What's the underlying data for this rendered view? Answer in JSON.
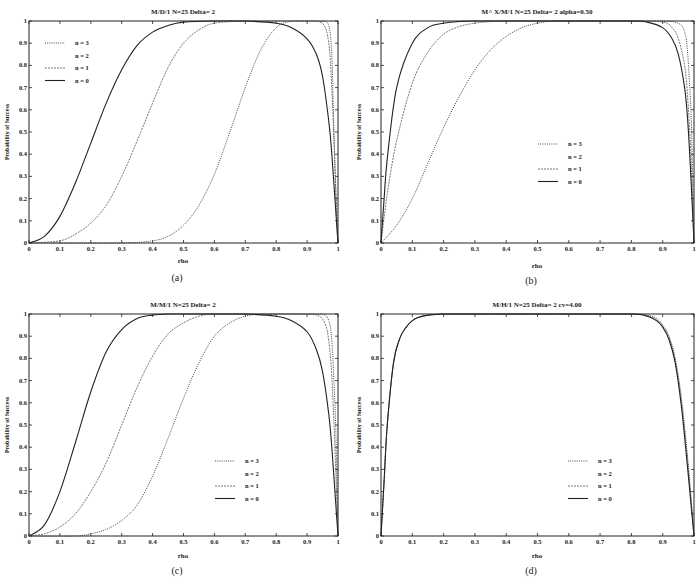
{
  "figure": {
    "panels": [
      {
        "id": "a",
        "caption": "(a)",
        "title": "M/D/1 N=25 Delta= 2",
        "ylabel": "Probability of Success",
        "xlabel": "rho",
        "box": {
          "left": 29,
          "right": 338,
          "top": 21,
          "bottom": 243
        },
        "legend": {
          "x": 45,
          "y": 43,
          "dy": 12.5
        }
      },
      {
        "id": "b",
        "caption": "(b)",
        "title": "M^ X/M/1 N=25 Delta= 2 alpha=0.50",
        "ylabel": "Probability of Success",
        "xlabel": "rho",
        "box": {
          "left": 381,
          "right": 694,
          "top": 21,
          "bottom": 243
        },
        "legend": {
          "x": 538,
          "y": 144,
          "dy": 12.5
        }
      },
      {
        "id": "c",
        "caption": "(c)",
        "title": "M/M/1 N=25 Delta= 2",
        "ylabel": "Probability of Success",
        "xlabel": "rho",
        "box": {
          "left": 29,
          "right": 338,
          "top": 314,
          "bottom": 536
        },
        "legend": {
          "x": 215,
          "y": 461,
          "dy": 12.5
        }
      },
      {
        "id": "d",
        "caption": "(d)",
        "title": "M/H/1 N=25 Delta= 2 cv=4.00",
        "ylabel": "Probability of Success",
        "xlabel": "rho",
        "box": {
          "left": 381,
          "right": 694,
          "top": 314,
          "bottom": 536
        },
        "legend": {
          "x": 568,
          "y": 461,
          "dy": 12.5
        }
      }
    ]
  },
  "chart_data": [
    {
      "type": "line",
      "panel": "a",
      "title": "M/D/1 N=25 Delta= 2",
      "xlabel": "rho",
      "ylabel": "Probability of Success",
      "xlim": [
        0,
        1
      ],
      "ylim": [
        0,
        1
      ],
      "xticks": [
        "0",
        "0.1",
        "0.2",
        "0.3",
        "0.4",
        "0.5",
        "0.6",
        "0.7",
        "0.8",
        "0.9",
        "1"
      ],
      "yticks": [
        "0",
        "0.1",
        "0.2",
        "0.3",
        "0.4",
        "0.5",
        "0.6",
        "0.7",
        "0.8",
        "0.9",
        "1"
      ],
      "grid": false,
      "legend_position": "upper left",
      "series": [
        {
          "name": "n = 3",
          "style": "dotted",
          "x": [
            0,
            0.3,
            0.4,
            0.45,
            0.5,
            0.55,
            0.6,
            0.65,
            0.7,
            0.75,
            0.8,
            0.85,
            0.9,
            0.95,
            0.97,
            0.98,
            0.985,
            0.99,
            0.995,
            1.0
          ],
          "y": [
            0,
            0.0,
            0.01,
            0.03,
            0.08,
            0.17,
            0.31,
            0.5,
            0.7,
            0.87,
            0.97,
            1.0,
            1.0,
            1.0,
            0.98,
            0.85,
            0.6,
            0.35,
            0.12,
            0.0
          ]
        },
        {
          "name": "n = 2",
          "style": "none",
          "x": [],
          "y": []
        },
        {
          "name": "n = 1",
          "style": "dashdot",
          "x": [
            0,
            0.1,
            0.15,
            0.2,
            0.25,
            0.3,
            0.35,
            0.4,
            0.45,
            0.5,
            0.55,
            0.6,
            0.7,
            0.8,
            0.9,
            0.95,
            0.97,
            0.98,
            0.99,
            1.0
          ],
          "y": [
            0,
            0.01,
            0.04,
            0.09,
            0.17,
            0.3,
            0.46,
            0.63,
            0.79,
            0.9,
            0.96,
            0.99,
            1.0,
            1.0,
            1.0,
            0.99,
            0.9,
            0.7,
            0.35,
            0.0
          ]
        },
        {
          "name": "n = 0",
          "style": "solid",
          "x": [
            0,
            0.05,
            0.1,
            0.15,
            0.2,
            0.25,
            0.3,
            0.35,
            0.4,
            0.45,
            0.5,
            0.6,
            0.7,
            0.8,
            0.85,
            0.9,
            0.93,
            0.95,
            0.97,
            0.98,
            0.99,
            1.0
          ],
          "y": [
            0,
            0.03,
            0.12,
            0.27,
            0.45,
            0.63,
            0.78,
            0.89,
            0.95,
            0.98,
            0.995,
            1.0,
            1.0,
            0.99,
            0.97,
            0.92,
            0.85,
            0.75,
            0.55,
            0.4,
            0.2,
            0.0
          ]
        }
      ]
    },
    {
      "type": "line",
      "panel": "b",
      "title": "M^ X/M/1 N=25 Delta= 2 alpha=0.50",
      "xlabel": "rho",
      "ylabel": "Probability of Success",
      "xlim": [
        0,
        1
      ],
      "ylim": [
        0,
        1
      ],
      "xticks": [
        "0",
        "0.1",
        "0.2",
        "0.3",
        "0.4",
        "0.5",
        "0.6",
        "0.7",
        "0.8",
        "0.9",
        "1"
      ],
      "yticks": [
        "0",
        "0.1",
        "0.2",
        "0.3",
        "0.4",
        "0.5",
        "0.6",
        "0.7",
        "0.8",
        "0.9",
        "1"
      ],
      "grid": false,
      "legend_position": "center right",
      "series": [
        {
          "name": "n = 3",
          "style": "dotted",
          "x": [
            0,
            0.05,
            0.1,
            0.15,
            0.2,
            0.25,
            0.3,
            0.35,
            0.4,
            0.45,
            0.5,
            0.55,
            0.6,
            0.7,
            0.8,
            0.9,
            0.95,
            0.97,
            0.98,
            0.99,
            0.995,
            1.0
          ],
          "y": [
            0,
            0.08,
            0.2,
            0.36,
            0.52,
            0.66,
            0.78,
            0.87,
            0.93,
            0.97,
            0.99,
            1.0,
            1.0,
            1.0,
            1.0,
            1.0,
            0.99,
            0.95,
            0.85,
            0.6,
            0.35,
            0.0
          ]
        },
        {
          "name": "n = 2",
          "style": "none",
          "x": [],
          "y": []
        },
        {
          "name": "n = 1",
          "style": "dashdot",
          "x": [
            0,
            0.02,
            0.05,
            0.1,
            0.15,
            0.2,
            0.25,
            0.3,
            0.35,
            0.4,
            0.5,
            0.6,
            0.8,
            0.9,
            0.93,
            0.95,
            0.97,
            0.98,
            0.99,
            1.0
          ],
          "y": [
            0,
            0.22,
            0.46,
            0.72,
            0.86,
            0.94,
            0.975,
            0.99,
            0.997,
            1.0,
            1.0,
            1.0,
            1.0,
            0.995,
            0.97,
            0.92,
            0.8,
            0.65,
            0.4,
            0.0
          ]
        },
        {
          "name": "n = 0",
          "style": "solid",
          "x": [
            0,
            0.01,
            0.02,
            0.05,
            0.1,
            0.15,
            0.2,
            0.25,
            0.3,
            0.4,
            0.6,
            0.8,
            0.85,
            0.9,
            0.93,
            0.95,
            0.97,
            0.98,
            0.99,
            1.0
          ],
          "y": [
            0,
            0.2,
            0.38,
            0.7,
            0.9,
            0.97,
            0.99,
            0.998,
            1.0,
            1.0,
            1.0,
            1.0,
            0.995,
            0.97,
            0.92,
            0.85,
            0.7,
            0.55,
            0.3,
            0.0
          ]
        }
      ]
    },
    {
      "type": "line",
      "panel": "c",
      "title": "M/M/1 N=25 Delta= 2",
      "xlabel": "rho",
      "ylabel": "Probability of Success",
      "xlim": [
        0,
        1
      ],
      "ylim": [
        0,
        1
      ],
      "xticks": [
        "0",
        "0.1",
        "0.2",
        "0.3",
        "0.4",
        "0.5",
        "0.6",
        "0.7",
        "0.8",
        "0.9",
        "1"
      ],
      "yticks": [
        "0",
        "0.1",
        "0.2",
        "0.3",
        "0.4",
        "0.5",
        "0.6",
        "0.7",
        "0.8",
        "0.9",
        "1"
      ],
      "grid": false,
      "legend_position": "center right",
      "series": [
        {
          "name": "n = 3",
          "style": "dotted",
          "x": [
            0,
            0.15,
            0.2,
            0.25,
            0.3,
            0.35,
            0.4,
            0.45,
            0.5,
            0.55,
            0.6,
            0.65,
            0.7,
            0.75,
            0.8,
            0.9,
            0.95,
            0.97,
            0.98,
            0.99,
            0.995,
            1.0
          ],
          "y": [
            0,
            0.0,
            0.01,
            0.03,
            0.07,
            0.14,
            0.27,
            0.44,
            0.62,
            0.78,
            0.9,
            0.96,
            0.99,
            1.0,
            1.0,
            1.0,
            1.0,
            0.97,
            0.88,
            0.6,
            0.35,
            0.0
          ]
        },
        {
          "name": "n = 2",
          "style": "none",
          "x": [],
          "y": []
        },
        {
          "name": "n = 1",
          "style": "dashdot",
          "x": [
            0,
            0.05,
            0.1,
            0.15,
            0.2,
            0.25,
            0.3,
            0.35,
            0.4,
            0.45,
            0.5,
            0.55,
            0.6,
            0.7,
            0.8,
            0.9,
            0.94,
            0.96,
            0.97,
            0.98,
            0.99,
            1.0
          ],
          "y": [
            0,
            0.01,
            0.04,
            0.1,
            0.2,
            0.33,
            0.5,
            0.67,
            0.81,
            0.91,
            0.96,
            0.99,
            1.0,
            1.0,
            1.0,
            1.0,
            0.99,
            0.95,
            0.88,
            0.72,
            0.4,
            0.0
          ]
        },
        {
          "name": "n = 0",
          "style": "solid",
          "x": [
            0,
            0.05,
            0.1,
            0.15,
            0.2,
            0.25,
            0.3,
            0.35,
            0.4,
            0.45,
            0.5,
            0.6,
            0.7,
            0.8,
            0.85,
            0.9,
            0.93,
            0.95,
            0.97,
            0.98,
            0.99,
            1.0
          ],
          "y": [
            0,
            0.05,
            0.2,
            0.42,
            0.65,
            0.83,
            0.93,
            0.98,
            0.995,
            1.0,
            1.0,
            1.0,
            1.0,
            0.99,
            0.97,
            0.92,
            0.84,
            0.74,
            0.55,
            0.4,
            0.2,
            0.0
          ]
        }
      ]
    },
    {
      "type": "line",
      "panel": "d",
      "title": "M/H/1 N=25 Delta= 2 cv=4.00",
      "xlabel": "rho",
      "ylabel": "Probability of Success",
      "xlim": [
        0,
        1
      ],
      "ylim": [
        0,
        1
      ],
      "xticks": [
        "0",
        "0.1",
        "0.2",
        "0.3",
        "0.4",
        "0.5",
        "0.6",
        "0.7",
        "0.8",
        "0.9",
        "1"
      ],
      "yticks": [
        "0",
        "0.1",
        "0.2",
        "0.3",
        "0.4",
        "0.5",
        "0.6",
        "0.7",
        "0.8",
        "0.9",
        "1"
      ],
      "grid": false,
      "legend_position": "center right",
      "series": [
        {
          "name": "n = 3",
          "style": "dotted",
          "x": [
            0,
            0.01,
            0.02,
            0.04,
            0.06,
            0.08,
            0.1,
            0.12,
            0.15,
            0.2,
            0.3,
            0.6,
            0.8,
            0.85,
            0.88,
            0.9,
            0.92,
            0.94,
            0.96,
            0.98,
            0.99,
            1.0
          ],
          "y": [
            0,
            0.25,
            0.5,
            0.78,
            0.89,
            0.94,
            0.97,
            0.985,
            0.995,
            1.0,
            1.0,
            1.0,
            1.0,
            0.995,
            0.98,
            0.95,
            0.9,
            0.8,
            0.62,
            0.35,
            0.18,
            0.0
          ]
        },
        {
          "name": "n = 2",
          "style": "none",
          "x": [],
          "y": []
        },
        {
          "name": "n = 1",
          "style": "dashdot",
          "x": [
            0,
            0.01,
            0.02,
            0.04,
            0.06,
            0.08,
            0.1,
            0.12,
            0.15,
            0.2,
            0.3,
            0.6,
            0.8,
            0.85,
            0.88,
            0.9,
            0.92,
            0.94,
            0.96,
            0.98,
            0.99,
            1.0
          ],
          "y": [
            0,
            0.25,
            0.5,
            0.78,
            0.89,
            0.94,
            0.97,
            0.985,
            0.995,
            1.0,
            1.0,
            1.0,
            1.0,
            0.993,
            0.975,
            0.945,
            0.895,
            0.79,
            0.6,
            0.33,
            0.17,
            0.0
          ]
        },
        {
          "name": "n = 0",
          "style": "solid",
          "x": [
            0,
            0.01,
            0.02,
            0.04,
            0.06,
            0.08,
            0.1,
            0.12,
            0.15,
            0.2,
            0.3,
            0.6,
            0.8,
            0.85,
            0.88,
            0.9,
            0.92,
            0.94,
            0.96,
            0.98,
            0.99,
            1.0
          ],
          "y": [
            0,
            0.25,
            0.5,
            0.78,
            0.89,
            0.94,
            0.97,
            0.985,
            0.995,
            1.0,
            1.0,
            1.0,
            1.0,
            0.99,
            0.97,
            0.94,
            0.885,
            0.78,
            0.58,
            0.3,
            0.15,
            0.0
          ]
        }
      ]
    }
  ]
}
